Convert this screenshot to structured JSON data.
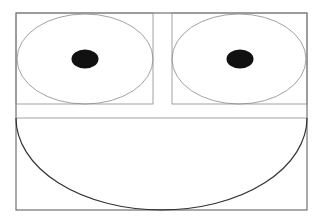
{
  "figure": {
    "colors": {
      "background": "#ffffff",
      "frame_stroke": "#555555",
      "thin_stroke": "#8a8a8a",
      "pupil_fill": "#111111",
      "mouth_stroke": "#333333"
    }
  },
  "shapes": {
    "outer_frame": {
      "x": 16,
      "y": 13,
      "width": 291,
      "height": 197
    },
    "left_eye_box": {
      "x": 16,
      "y": 13,
      "width": 137,
      "height": 91
    },
    "right_eye_box": {
      "x": 172,
      "y": 13,
      "width": 135,
      "height": 91
    },
    "divider_line": {
      "x1": 16,
      "y1": 118,
      "x2": 307,
      "y2": 118
    },
    "left_eye": {
      "cx": 85,
      "cy": 59,
      "rx": 68,
      "ry": 45
    },
    "right_eye": {
      "cx": 239,
      "cy": 59,
      "rx": 67,
      "ry": 45
    },
    "left_pupil": {
      "cx": 85,
      "cy": 59,
      "rx": 13.5,
      "ry": 9.5
    },
    "right_pupil": {
      "cx": 240,
      "cy": 59,
      "rx": 13.5,
      "ry": 9.5
    },
    "mouth": {
      "cx": 161.5,
      "cy": 118,
      "rx": 145.5,
      "ry": 92
    }
  }
}
